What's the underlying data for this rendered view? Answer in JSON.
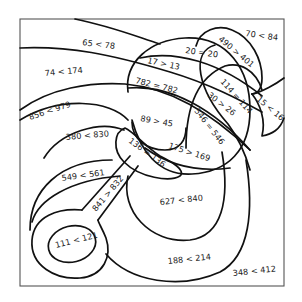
{
  "worksheet": {
    "type": "color-by-comparison puzzle",
    "colors": {
      "line": "#111111",
      "frame": "#555555",
      "text": "#222222",
      "background": "#ffffff"
    },
    "regions": [
      {
        "id": "r1",
        "label": "65 < 78"
      },
      {
        "id": "r2",
        "label": "74 < 174"
      },
      {
        "id": "r3",
        "label": "856 < 979"
      },
      {
        "id": "r4",
        "label": "380 < 830"
      },
      {
        "id": "r5",
        "label": "549 < 561"
      },
      {
        "id": "r6",
        "label": "841 > 832"
      },
      {
        "id": "r7",
        "label": "111 < 121"
      },
      {
        "id": "r8",
        "label": "17 > 13"
      },
      {
        "id": "r9",
        "label": "20 = 20"
      },
      {
        "id": "r10",
        "label": "490 > 401"
      },
      {
        "id": "r11",
        "label": "70 < 84"
      },
      {
        "id": "r12",
        "label": "782 = 782"
      },
      {
        "id": "r13",
        "label": "114 = 114"
      },
      {
        "id": "r14",
        "label": "15 < 16"
      },
      {
        "id": "r15",
        "label": "30 > 26"
      },
      {
        "id": "r16",
        "label": "89 > 45"
      },
      {
        "id": "r17",
        "label": "546 = 546"
      },
      {
        "id": "r18",
        "label": "136 = 136"
      },
      {
        "id": "r19",
        "label": "175 > 169"
      },
      {
        "id": "r20",
        "label": "627 < 840"
      },
      {
        "id": "r21",
        "label": "188 < 214"
      },
      {
        "id": "r22",
        "label": "348 < 412"
      }
    ]
  }
}
